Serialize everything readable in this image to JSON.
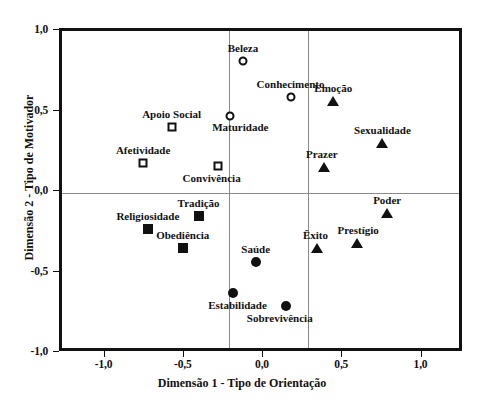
{
  "chart_data": {
    "type": "scatter",
    "title": "",
    "xlabel": "Dimensão 1 - Tipo de Orientação",
    "ylabel": "Dimensão 2 - Tipo de Motivador",
    "xlim": [
      -1.28,
      1.26
    ],
    "ylim": [
      -1.0,
      1.0
    ],
    "xticks": [
      -1.0,
      -0.5,
      0.0,
      0.5,
      1.0
    ],
    "yticks": [
      -1.0,
      -0.5,
      0.0,
      0.5,
      1.0
    ],
    "xticklabels": [
      "-1,0",
      "-0,5",
      "0,0",
      "0,5",
      "1,0"
    ],
    "yticklabels": [
      "-1,0",
      "-0,5",
      "0,0",
      "0,5",
      "1,0"
    ],
    "grid": true,
    "vertical_gridlines": [
      -0.23,
      0.27
    ],
    "horizontal_gridlines": [
      0.0
    ],
    "legend": "none",
    "series": [
      {
        "name": "Motivador: círculo aberto",
        "marker": "circle-open",
        "points": [
          {
            "label": "Beleza",
            "x": -0.12,
            "y": 0.8,
            "label_dx": 0,
            "label_dy": -13
          },
          {
            "label": "Conhecimento",
            "x": 0.18,
            "y": 0.58,
            "label_dx": 0,
            "label_dy": -13
          },
          {
            "label": "Maturidade",
            "x": -0.2,
            "y": 0.46,
            "label_dx": 10,
            "label_dy": 11
          }
        ]
      },
      {
        "name": "Motivador: quadrado aberto",
        "marker": "square-open",
        "points": [
          {
            "label": "Apoio Social",
            "x": -0.57,
            "y": 0.39,
            "label_dx": 0,
            "label_dy": -13
          },
          {
            "label": "Afetividade",
            "x": -0.75,
            "y": 0.17,
            "label_dx": 0,
            "label_dy": -13
          },
          {
            "label": "Convivência",
            "x": -0.28,
            "y": 0.15,
            "label_dx": -6,
            "label_dy": 12
          }
        ]
      },
      {
        "name": "Motivador: quadrado preenchido",
        "marker": "square-filled",
        "points": [
          {
            "label": "Tradição",
            "x": -0.4,
            "y": -0.16,
            "label_dx": 0,
            "label_dy": -13
          },
          {
            "label": "Religiosidade",
            "x": -0.72,
            "y": -0.24,
            "label_dx": 0,
            "label_dy": -13
          },
          {
            "label": "Obediência",
            "x": -0.5,
            "y": -0.36,
            "label_dx": 0,
            "label_dy": -13
          }
        ]
      },
      {
        "name": "Motivador: círculo preenchido",
        "marker": "circle-filled",
        "points": [
          {
            "label": "Saúde",
            "x": -0.04,
            "y": -0.45,
            "label_dx": 0,
            "label_dy": -13
          },
          {
            "label": "Estabilidade",
            "x": -0.18,
            "y": -0.64,
            "label_dx": 4,
            "label_dy": 12
          },
          {
            "label": "Sobrevivência",
            "x": 0.15,
            "y": -0.72,
            "label_dx": -6,
            "label_dy": 12
          }
        ]
      },
      {
        "name": "Motivador: triângulo preenchido",
        "marker": "triangle-filled",
        "points": [
          {
            "label": "Emoção",
            "x": 0.45,
            "y": 0.55,
            "label_dx": 0,
            "label_dy": -13
          },
          {
            "label": "Sexualidade",
            "x": 0.76,
            "y": 0.29,
            "label_dx": 0,
            "label_dy": -13
          },
          {
            "label": "Prazer",
            "x": 0.39,
            "y": 0.14,
            "label_dx": -2,
            "label_dy": -13
          },
          {
            "label": "Poder",
            "x": 0.79,
            "y": -0.14,
            "label_dx": 0,
            "label_dy": -13
          },
          {
            "label": "Prestígio",
            "x": 0.6,
            "y": -0.33,
            "label_dx": 1,
            "label_dy": -13
          },
          {
            "label": "Êxito",
            "x": 0.35,
            "y": -0.36,
            "label_dx": -2,
            "label_dy": -13
          }
        ]
      }
    ]
  }
}
